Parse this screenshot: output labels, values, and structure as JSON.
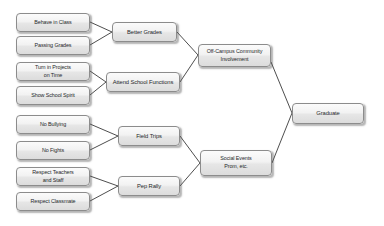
{
  "diagram": {
    "background_color": "#ffffff",
    "node_fill": "#ebebeb",
    "node_border": "#8c8c8c",
    "connector_color": "#3a3a3a",
    "columns": {
      "inputs": [
        {
          "id": "behave-in-class",
          "label": "Behave in Class"
        },
        {
          "id": "passing-grades",
          "label": "Passing Grades"
        },
        {
          "id": "turn-in-projects",
          "label": "Turn in Projects",
          "label2": "on Time"
        },
        {
          "id": "show-school-spirit",
          "label": "Show School Spirit"
        },
        {
          "id": "no-bullying",
          "label": "No Bullying"
        },
        {
          "id": "no-fights",
          "label": "No Fights"
        },
        {
          "id": "respect-teachers",
          "label": "Respect Teachers",
          "label2": "and Staff"
        },
        {
          "id": "respect-classmate",
          "label": "Respect Classmate"
        }
      ],
      "middle": [
        {
          "id": "better-grades",
          "label": "Better Grades"
        },
        {
          "id": "attend-school-functions",
          "label": "Attend School Functions"
        },
        {
          "id": "field-trips",
          "label": "Field Trips"
        },
        {
          "id": "pep-rally",
          "label": "Pep Rally"
        }
      ],
      "outcomes": [
        {
          "id": "off-campus-community",
          "label": "Off-Campus Community",
          "label2": "Involvement"
        },
        {
          "id": "social-events",
          "label": "Social Events",
          "label2": "Prom, etc."
        }
      ],
      "final": {
        "id": "graduate",
        "label": "Graduate"
      }
    }
  }
}
